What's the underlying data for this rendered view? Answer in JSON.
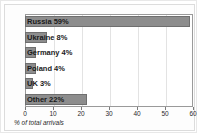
{
  "chart_data": {
    "type": "bar",
    "orientation": "horizontal",
    "title": "",
    "xlabel": "% of total arrivals",
    "ylabel": "",
    "xlim": [
      0,
      60
    ],
    "xticks": [
      0,
      10,
      20,
      30,
      40,
      50,
      60
    ],
    "grid": true,
    "legend": null,
    "categories": [
      "Russia",
      "Ukraine",
      "Germany",
      "Poland",
      "UK",
      "Other"
    ],
    "values": [
      59,
      8,
      4,
      4,
      3,
      22
    ],
    "bar_labels": [
      "Russia 59%",
      "Ukraine 8%",
      "Germany 4%",
      "Poland 4%",
      "UK 3%",
      "Other 22%"
    ],
    "colors": {
      "bar_fill": "#8d8d8d",
      "bar_stroke": "#6f6f6f",
      "plot_background": "#ffffff",
      "gridline": "#e3e3e3",
      "axis": "#9a9a9a",
      "text": "#1a1a1a"
    }
  }
}
